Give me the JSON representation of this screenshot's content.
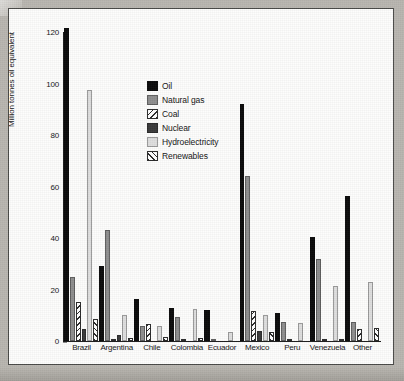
{
  "chart_data": {
    "type": "bar",
    "title": "",
    "xlabel": "",
    "ylabel": "Million tonnes oil equivalent",
    "ylim": [
      0,
      120
    ],
    "yticks": [
      0,
      20,
      40,
      60,
      80,
      100,
      120
    ],
    "grid": false,
    "legend_position": "upper-center-inside",
    "categories": [
      "Brazil",
      "Argentina",
      "Chile",
      "Colombia",
      "Ecuador",
      "Mexico",
      "Peru",
      "Venezuela",
      "Other"
    ],
    "series": [
      {
        "name": "Oil",
        "key": "oil",
        "color": "#0a0a0a",
        "values": [
          121.5,
          29.0,
          16.5,
          13.0,
          12.0,
          92.0,
          11.0,
          40.5,
          56.5
        ]
      },
      {
        "name": "Natural gas",
        "key": "gas",
        "color": "#8e8e8e",
        "values": [
          25.0,
          43.0,
          6.0,
          9.5,
          0.4,
          64.0,
          7.5,
          32.0,
          7.5
        ]
      },
      {
        "name": "Coal",
        "key": "coal",
        "color": "#ffffff",
        "values": [
          15.0,
          0.5,
          6.5,
          0.6,
          0.0,
          11.5,
          0.7,
          0.4,
          4.5
        ]
      },
      {
        "name": "Nuclear",
        "key": "nuclear",
        "color": "#3a3a3a",
        "values": [
          4.5,
          2.5,
          0.0,
          0.0,
          0.0,
          4.0,
          0.0,
          0.0,
          0.0
        ]
      },
      {
        "name": "Hydroelectricity",
        "key": "hydro",
        "color": "#dedede",
        "values": [
          97.5,
          10.0,
          6.0,
          12.5,
          3.5,
          10.0,
          7.0,
          21.5,
          23.0
        ]
      },
      {
        "name": "Renewables",
        "key": "renew",
        "color": "#ffffff",
        "values": [
          8.5,
          1.3,
          1.5,
          1.3,
          0.0,
          3.5,
          0.0,
          0.3,
          5.0
        ]
      }
    ]
  },
  "axis": {
    "y_title": "Million tonnes oil equivalent",
    "tick_labels": [
      "0",
      "20",
      "40",
      "60",
      "80",
      "100",
      "120"
    ]
  },
  "legend": {
    "items": [
      {
        "label": "Oil",
        "key": "oil"
      },
      {
        "label": "Natural gas",
        "key": "gas"
      },
      {
        "label": "Coal",
        "key": "coal"
      },
      {
        "label": "Nuclear",
        "key": "nuclear"
      },
      {
        "label": "Hydroelectricity",
        "key": "hydro"
      },
      {
        "label": "Renewables",
        "key": "renew"
      }
    ]
  }
}
